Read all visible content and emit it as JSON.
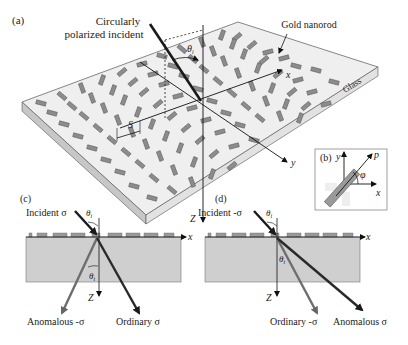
{
  "figure": {
    "panel_a": {
      "label": "(a)",
      "incident_label_line1": "Circularly",
      "incident_label_line2": "polarized incident",
      "nanorod_label": "Gold nanorod",
      "substrate_label": "Glass",
      "theta": "θ",
      "theta_sub": "i",
      "period_label": "S",
      "axis_x": "x",
      "axis_y": "y",
      "axis_z": "Z"
    },
    "panel_b": {
      "label": "(b)",
      "axis_x": "x",
      "axis_y": "y",
      "axis_p": "p",
      "angle": "φ"
    },
    "panel_c": {
      "label": "(c)",
      "incident": "Incident σ",
      "theta": "θ",
      "theta_sub": "i",
      "theta_t": "θ",
      "theta_t_sub": "t",
      "axis_x": "x",
      "axis_z": "Z",
      "beam_left": "Anomalous -σ",
      "beam_right": "Ordinary σ"
    },
    "panel_d": {
      "label": "(d)",
      "incident": "Incident -σ",
      "theta": "θ",
      "theta_sub": "i",
      "theta_t": "θ",
      "theta_t_sub": "t",
      "axis_x": "x",
      "axis_z": "Z",
      "beam_left": "Ordinary -σ",
      "beam_right": "Anomalous σ"
    },
    "colors": {
      "rod": "#8a8a8a",
      "rod_edge": "#5a5a5a",
      "substrate_top": "#efefef",
      "substrate_side": "#c9c9c9",
      "substrate_front": "#dedede",
      "slab": "#cfcfcf",
      "dark_beam": "#2a2a2a",
      "gray_beam": "#6e6e6e"
    }
  }
}
